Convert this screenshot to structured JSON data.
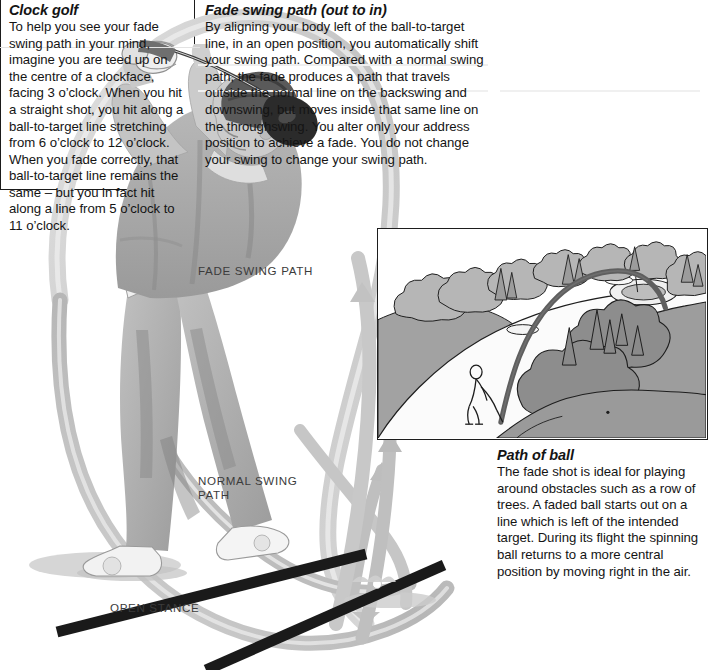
{
  "page": {
    "width": 711,
    "height": 670,
    "background": "#ffffff",
    "ink": "#141414"
  },
  "fade_swing_path": {
    "title": "Fade swing path (out to in)",
    "body": "By aligning your body left of the ball-to-target line, in an open position, you automatically shift your swing path. Compared with a normal swing path, the fade produces a path that travels outside the normal line on the backswing and downswing, but moves inside that same line on the throughswing. You alter only your address position to achieve a fade. You do not change your swing to change your swing path."
  },
  "clock_golf": {
    "title": "Clock golf",
    "body": "To help you see your fade swing path in your mind,  imagine you are teed up on the centre of a clockface, facing 3 o’clock. When you hit a straight shot, you hit along a ball-to-target line stretching from 6 o’clock to 12 o’clock. When you fade correctly, that ball-to-target line remains the same – but you in fact hit along a line from 5 o’clock to 11 o’clock."
  },
  "path_of_ball": {
    "title": "Path of ball",
    "body": "The fade shot is ideal for playing around obstacles such as a row of trees. A faded ball starts out on a line which is left of the intended target. During its flight the spinning ball returns to a more central position by moving right in the air."
  },
  "callouts": {
    "fade_swing_path": "FADE SWING PATH",
    "normal_swing_path": "NORMAL SWING\nPATH",
    "open_stance": "OPEN STANCE"
  },
  "illustration": {
    "subject": "golfer-at-top-of-follow-through-with-driver",
    "ribbons": [
      {
        "name": "fade-swing-path-ribbon",
        "color": "#c9c9c9"
      },
      {
        "name": "normal-swing-path-ribbon",
        "color": "#b9b9b9"
      }
    ],
    "stance_lines": [
      {
        "name": "open-stance-line",
        "color": "#1a1a1a"
      },
      {
        "name": "ball-to-target-line",
        "color": "#1a1a1a"
      }
    ]
  },
  "photo": {
    "caption_ref": "path_of_ball",
    "scene": "golf-hole-with-trees-green-and-faded-ball-flight",
    "elements": [
      "golfer-silhouette",
      "fairway",
      "tree-line",
      "green-with-bunkers",
      "ball-flight-arc"
    ],
    "colors": {
      "sky": "#ffffff",
      "fairway": "#f7f7f7",
      "rough": "#a0a0a0",
      "trees_light": "#b4b4b4",
      "trees_dark": "#8e8e8e",
      "outline": "#1d1d1d",
      "ball_arc": "#5a5a5a"
    }
  }
}
